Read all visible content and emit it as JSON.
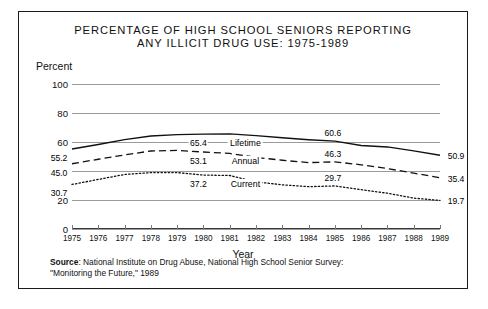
{
  "chart_data": {
    "type": "line",
    "title": "PERCENTAGE OF HIGH SCHOOL SENIORS REPORTING ANY ILLICIT DRUG USE: 1975-1989",
    "title_line1": "PERCENTAGE OF HIGH SCHOOL SENIORS REPORTING",
    "title_line2": "ANY ILLICIT DRUG USE: 1975-1989",
    "xlabel": "Year",
    "ylabel": "Percent",
    "ylim": [
      0,
      100
    ],
    "yticks": [
      0,
      20,
      40,
      60,
      80,
      100
    ],
    "ytick_labels": [
      "0",
      "20",
      "40",
      "60",
      "80",
      "100"
    ],
    "grid": true,
    "legend": "inline",
    "x": [
      1975,
      1976,
      1977,
      1978,
      1979,
      1980,
      1981,
      1982,
      1983,
      1984,
      1985,
      1986,
      1987,
      1988,
      1989
    ],
    "categories": [
      "1975",
      "1976",
      "1977",
      "1978",
      "1979",
      "1980",
      "1981",
      "1982",
      "1983",
      "1984",
      "1985",
      "1986",
      "1987",
      "1988",
      "1989"
    ],
    "series": [
      {
        "name": "Lifetime",
        "style": "solid",
        "values": [
          55.2,
          58.3,
          61.6,
          64.1,
          65.1,
          65.4,
          65.6,
          64.4,
          62.9,
          61.6,
          60.6,
          57.6,
          56.6,
          53.9,
          50.9
        ],
        "endpoint_labels": {
          "start": "55.2",
          "mid": "65.4",
          "late": "60.6",
          "end": "50.9"
        }
      },
      {
        "name": "Annual",
        "style": "dashed",
        "values": [
          45.0,
          48.1,
          51.1,
          53.8,
          54.2,
          53.1,
          52.1,
          49.4,
          47.4,
          45.8,
          46.3,
          44.3,
          41.7,
          38.5,
          35.4
        ],
        "endpoint_labels": {
          "start": "45.0",
          "mid": "53.1",
          "late": "46.3",
          "end": "35.4"
        }
      },
      {
        "name": "Current",
        "style": "dotted",
        "values": [
          30.7,
          34.2,
          37.6,
          38.9,
          38.9,
          37.2,
          36.9,
          32.5,
          30.5,
          29.2,
          29.7,
          27.1,
          24.7,
          21.3,
          19.7
        ],
        "endpoint_labels": {
          "start": "30.7",
          "mid": "37.2",
          "late": "29.7",
          "end": "19.7"
        }
      }
    ],
    "annotations": [
      {
        "text": "55.2",
        "series": "Lifetime",
        "position": "start"
      },
      {
        "text": "65.4",
        "series": "Lifetime",
        "position": "mid"
      },
      {
        "text": "60.6",
        "series": "Lifetime",
        "position": "late"
      },
      {
        "text": "50.9",
        "series": "Lifetime",
        "position": "end"
      },
      {
        "text": "45.0",
        "series": "Annual",
        "position": "start"
      },
      {
        "text": "53.1",
        "series": "Annual",
        "position": "mid"
      },
      {
        "text": "46.3",
        "series": "Annual",
        "position": "late"
      },
      {
        "text": "35.4",
        "series": "Annual",
        "position": "end"
      },
      {
        "text": "30.7",
        "series": "Current",
        "position": "start"
      },
      {
        "text": "37.2",
        "series": "Current",
        "position": "mid"
      },
      {
        "text": "29.7",
        "series": "Current",
        "position": "late"
      },
      {
        "text": "19.7",
        "series": "Current",
        "position": "end"
      }
    ]
  },
  "source": {
    "label": "Source",
    "line1_rest": ": National Institute on Drug Abuse, National High School Senior Survey:",
    "line2": "\"Monitoring the Future,\" 1989"
  }
}
